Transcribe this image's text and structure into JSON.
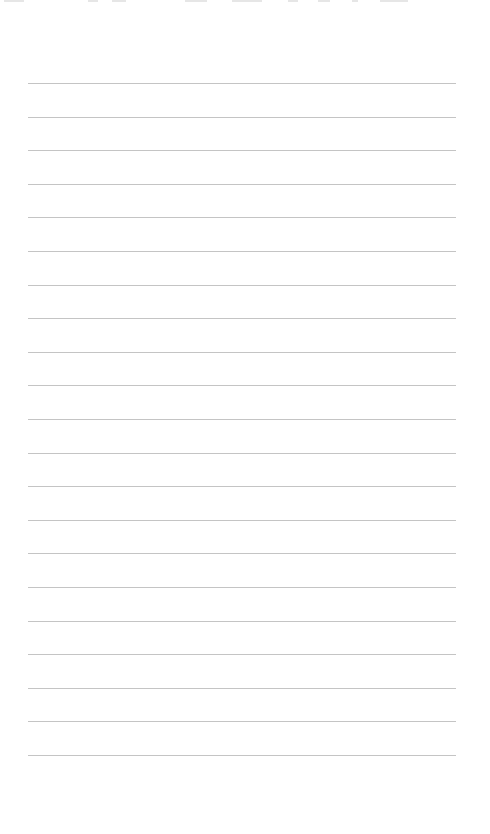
{
  "page": {
    "type": "lined-paper",
    "line_count": 21,
    "line_color": "#c4c4c4",
    "background": "#ffffff"
  }
}
